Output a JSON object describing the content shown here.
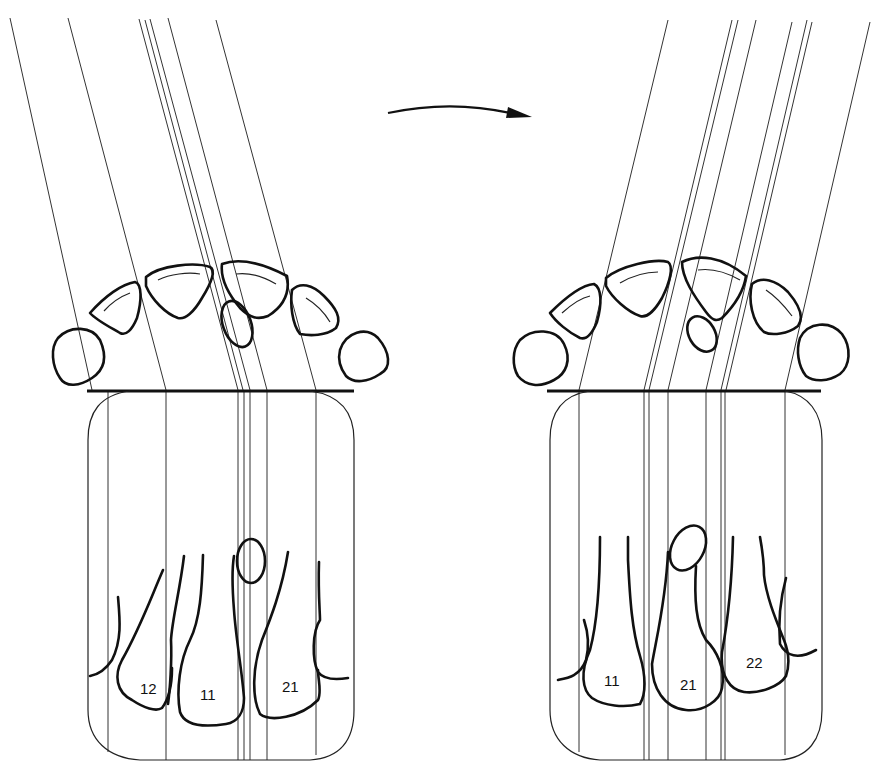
{
  "figure": {
    "arrow": {
      "direction": "left-to-right",
      "meaning": "x-ray tube shift"
    },
    "left_panel": {
      "tooth_labels": [
        "12",
        "11",
        "21"
      ]
    },
    "right_panel": {
      "tooth_labels": [
        "11",
        "21",
        "22"
      ]
    }
  },
  "colors": {
    "ink": "#111111",
    "background": "#ffffff"
  }
}
